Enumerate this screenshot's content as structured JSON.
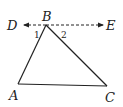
{
  "diagram": {
    "type": "geometry-triangle-with-parallel-line",
    "points": {
      "A": {
        "label": "A",
        "x": 18,
        "y": 84
      },
      "B": {
        "label": "B",
        "x": 46,
        "y": 25
      },
      "C": {
        "label": "C",
        "x": 107,
        "y": 86
      },
      "D": {
        "label": "D",
        "x": 24,
        "y": 25
      },
      "E": {
        "label": "E",
        "x": 103,
        "y": 25
      }
    },
    "labels": {
      "A": "A",
      "B": "B",
      "C": "C",
      "D": "D",
      "E": "E",
      "angle1": "1",
      "angle2": "2"
    },
    "segments": [
      {
        "from": "A",
        "to": "B",
        "style": "solid"
      },
      {
        "from": "B",
        "to": "C",
        "style": "solid"
      },
      {
        "from": "A",
        "to": "C",
        "style": "solid"
      },
      {
        "from": "B",
        "to": "D",
        "style": "dashed",
        "arrow": "D"
      },
      {
        "from": "B",
        "to": "E",
        "style": "dashed",
        "arrow": "E"
      }
    ],
    "colors": {
      "stroke": "#222222",
      "background": "#ffffff"
    }
  }
}
